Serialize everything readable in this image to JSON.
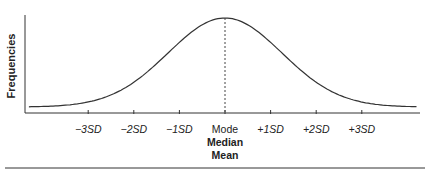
{
  "chart_data": {
    "type": "line",
    "title": "",
    "subtitle": "Normal distribution (bell curve)",
    "xlabel": "",
    "ylabel": "Frequencies",
    "x_ticks": [
      {
        "sign": "−3",
        "unit": "SD",
        "value": -3
      },
      {
        "sign": "−2",
        "unit": "SD",
        "value": -2
      },
      {
        "sign": "−1",
        "unit": "SD",
        "value": -1
      },
      {
        "sign": "+1",
        "unit": "SD",
        "value": 1
      },
      {
        "sign": "+2",
        "unit": "SD",
        "value": 2
      },
      {
        "sign": "+3",
        "unit": "SD",
        "value": 3
      }
    ],
    "center_labels": [
      "Mode",
      "Median",
      "Mean"
    ],
    "center_value": 0,
    "xlim": [
      -4.3,
      4.2
    ],
    "series": [
      {
        "name": "Normal distribution",
        "x": [
          -4.3,
          -4,
          -3.5,
          -3,
          -2.5,
          -2,
          -1.5,
          -1,
          -0.5,
          0,
          0.5,
          1,
          1.5,
          2,
          2.5,
          3,
          3.5,
          4,
          4.2
        ],
        "values": [
          0.02,
          0.03,
          0.06,
          0.1,
          0.19,
          0.32,
          0.5,
          0.7,
          0.88,
          1.0,
          0.88,
          0.7,
          0.5,
          0.32,
          0.19,
          0.1,
          0.06,
          0.03,
          0.02
        ]
      }
    ],
    "annotations": [
      {
        "type": "dashed-vertical-line",
        "x": 0,
        "label": "Mode / Median / Mean"
      }
    ],
    "grid": false,
    "legend": "none",
    "y_ticks": []
  },
  "labels": {
    "ylabel": "Frequencies",
    "mode": "Mode",
    "median": "Median",
    "mean": "Mean"
  },
  "colors": {
    "curve": "#333333",
    "axis": "#333333",
    "text": "#222222"
  }
}
